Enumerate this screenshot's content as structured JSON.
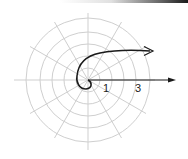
{
  "figure": {
    "type": "polar-grid-spiral",
    "center": [
      88,
      80
    ],
    "ring_radii_px": [
      12,
      24,
      36,
      48,
      62
    ],
    "radial_line_angle_step_deg": 30,
    "labels": [
      {
        "id": "r1",
        "text": "1"
      },
      {
        "id": "r3",
        "text": "3"
      }
    ],
    "colors": {
      "grid": "#c8c8c8",
      "curve": "#1a1a1a",
      "axis": "#1a1a1a"
    },
    "elements": {
      "spiral_curve": "spiral starting at origin, curling counterclockwise and extending to the right with arrowhead",
      "polar_axis": "horizontal ray from origin to the right with arrowhead"
    }
  }
}
